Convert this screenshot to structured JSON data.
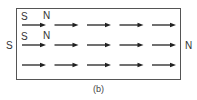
{
  "diagram": {
    "outer_labels": {
      "left": "S",
      "right": "N"
    },
    "inner_labels": [
      {
        "row": 0,
        "start": "S",
        "end": "N"
      },
      {
        "row": 1,
        "start": "S",
        "end": "N"
      }
    ],
    "rows": 3,
    "arrows_per_row": 5,
    "arrow_direction": "right",
    "caption": "(b)"
  }
}
